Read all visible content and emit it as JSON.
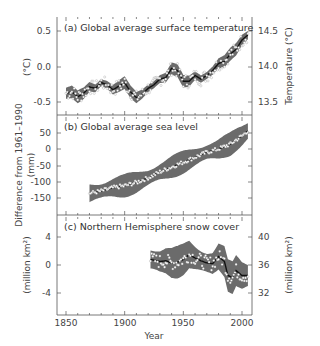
{
  "chart_data": [
    {
      "type": "line",
      "panel": "a",
      "title": "(a) Global average surface temperature",
      "xlabel": "Year",
      "ylabel": "(°C)",
      "ylabel_right": "Temperature (°C)",
      "xlim": [
        1845,
        2008
      ],
      "ylim": [
        -0.7,
        0.7
      ],
      "yticks": [
        0.5,
        0.0,
        -0.5
      ],
      "ytick_labels": [
        "0.5",
        "0.0",
        "-0.5"
      ],
      "yticks_right": [
        14.5,
        14.0,
        13.5
      ],
      "ytick_labels_right": [
        "14.5",
        "14.0",
        "13.5"
      ],
      "series": [
        {
          "name": "Decadal smoothed",
          "x": [
            1850,
            1855,
            1860,
            1865,
            1870,
            1875,
            1880,
            1885,
            1890,
            1895,
            1900,
            1905,
            1910,
            1915,
            1920,
            1925,
            1930,
            1935,
            1940,
            1945,
            1950,
            1955,
            1960,
            1965,
            1970,
            1975,
            1980,
            1985,
            1990,
            1995,
            2000,
            2005
          ],
          "values": [
            -0.37,
            -0.35,
            -0.42,
            -0.37,
            -0.28,
            -0.3,
            -0.22,
            -0.25,
            -0.32,
            -0.27,
            -0.22,
            -0.35,
            -0.43,
            -0.38,
            -0.3,
            -0.25,
            -0.17,
            -0.15,
            -0.02,
            -0.05,
            -0.2,
            -0.2,
            -0.12,
            -0.17,
            -0.12,
            -0.05,
            0.05,
            0.08,
            0.18,
            0.25,
            0.38,
            0.45
          ]
        }
      ],
      "uncertainty_band": true,
      "annual_points": true
    },
    {
      "type": "line",
      "panel": "b",
      "title": "(b) Global average sea level",
      "xlabel": "Year",
      "ylabel": "Difference from 1961–1990 (mm)",
      "xlim": [
        1845,
        2008
      ],
      "ylim": [
        -200,
        100
      ],
      "yticks": [
        50,
        0,
        -50,
        -100,
        -150
      ],
      "ytick_labels": [
        "50",
        "0",
        "-50",
        "-100",
        "-150"
      ],
      "series": [
        {
          "name": "Decadal smoothed",
          "x": [
            1870,
            1880,
            1890,
            1900,
            1910,
            1920,
            1930,
            1940,
            1950,
            1960,
            1970,
            1980,
            1990,
            2000,
            2005
          ],
          "values": [
            -135,
            -128,
            -118,
            -112,
            -102,
            -88,
            -70,
            -55,
            -40,
            -25,
            -10,
            0,
            15,
            40,
            55
          ]
        }
      ],
      "uncertainty_band": true,
      "annual_points": true
    },
    {
      "type": "line",
      "panel": "c",
      "title": "(c) Northern Hemisphere snow cover",
      "xlabel": "Year",
      "ylabel": "(million km²)",
      "ylabel_right": "(million km²)",
      "xlim": [
        1845,
        2008
      ],
      "ylim": [
        -6,
        6
      ],
      "yticks": [
        4,
        0,
        -4
      ],
      "ytick_labels": [
        "4",
        "0",
        "-4"
      ],
      "yticks_right": [
        40,
        36,
        32
      ],
      "ytick_labels_right": [
        "40",
        "36",
        "32"
      ],
      "series": [
        {
          "name": "Decadal smoothed",
          "x": [
            1922,
            1930,
            1935,
            1940,
            1945,
            1950,
            1955,
            1960,
            1965,
            1970,
            1975,
            1980,
            1985,
            1988,
            1992,
            1995,
            2000,
            2005
          ],
          "values": [
            0.8,
            0.5,
            0.6,
            0.3,
            0.4,
            0.8,
            1.5,
            1.0,
            0.6,
            0.3,
            0.2,
            1.2,
            0.5,
            -1.5,
            -1.8,
            -0.8,
            -1.5,
            -1.5
          ]
        }
      ],
      "uncertainty_band": true,
      "annual_points": true
    }
  ],
  "x_axis": {
    "label": "Year",
    "ticks": [
      1850,
      1900,
      1950,
      2000
    ],
    "tick_labels": [
      "1850",
      "1900",
      "1950",
      "2000"
    ]
  },
  "shared_left_label": "Difference from 1961–1990",
  "colors": {
    "band": "#6b6b6b",
    "line": "#111111",
    "points": "#ffffff",
    "axis": "#555555"
  }
}
